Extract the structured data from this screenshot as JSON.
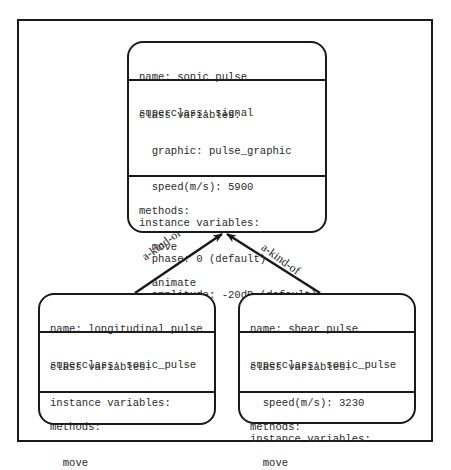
{
  "diagram": {
    "classes": {
      "sonic_pulse": {
        "name_line": "name: sonic_pulse",
        "superclass_line": "superclass: signal",
        "class_vars_header": "class variables:",
        "class_vars": [
          "graphic: pulse_graphic",
          "speed(m/s): 5900"
        ],
        "instance_vars_header": "instance variables:",
        "instance_vars": [
          "phase: 0 (default)",
          "amplitude: -20dB (default)",
          "position",
          "direction"
        ],
        "methods_header": "methods:",
        "methods": [
          "move",
          "animate",
          "attenuate"
        ]
      },
      "longitudinal_pulse": {
        "name_line": "name: longitudinal_pulse",
        "superclass_line": "superclass: sonic_pulse",
        "class_vars_header": "class variables:",
        "instance_vars_header": "instance variables:",
        "methods_header": "methods:",
        "methods": [
          "move"
        ]
      },
      "shear_pulse": {
        "name_line": "name: shear_pulse",
        "superclass_line": "superclass: sonic_pulse",
        "class_vars_header": "class variables:",
        "class_vars": [
          "speed(m/s): 3230"
        ],
        "instance_vars_header": "instance variables:",
        "methods_header": "methods:",
        "methods": [
          "move"
        ]
      }
    },
    "relations": [
      {
        "from": "longitudinal_pulse",
        "to": "sonic_pulse",
        "label": "a-kind-of"
      },
      {
        "from": "shear_pulse",
        "to": "sonic_pulse",
        "label": "a-kind-of"
      }
    ]
  }
}
